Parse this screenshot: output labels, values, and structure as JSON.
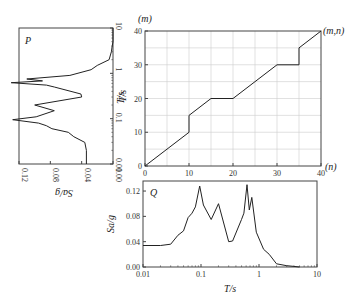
{
  "chart_data": [
    {
      "id": "P",
      "type": "line",
      "title": "P",
      "orientation": "rotated",
      "xlabel": "Sa/g",
      "ylabel": "T/s",
      "x_reversed": true,
      "xlim": [
        0.12,
        0.0
      ],
      "ylim": [
        0.01,
        10
      ],
      "y_scale": "log",
      "x_ticks": [
        "0.12",
        "0.08",
        "0.04",
        "0.00"
      ],
      "y_ticks": [
        "0.01",
        "0.1",
        "1",
        "10"
      ],
      "points": [
        [
          0.034,
          0.01
        ],
        [
          0.034,
          0.02
        ],
        [
          0.036,
          0.03
        ],
        [
          0.05,
          0.04
        ],
        [
          0.057,
          0.05
        ],
        [
          0.078,
          0.06
        ],
        [
          0.085,
          0.07
        ],
        [
          0.095,
          0.08
        ],
        [
          0.128,
          0.095
        ],
        [
          0.098,
          0.11
        ],
        [
          0.075,
          0.15
        ],
        [
          0.1,
          0.2
        ],
        [
          0.04,
          0.3
        ],
        [
          0.041,
          0.35
        ],
        [
          0.075,
          0.5
        ],
        [
          0.085,
          0.55
        ],
        [
          0.13,
          0.62
        ],
        [
          0.09,
          0.68
        ],
        [
          0.11,
          0.75
        ],
        [
          0.055,
          0.9
        ],
        [
          0.028,
          1.2
        ],
        [
          0.02,
          1.5
        ],
        [
          0.005,
          2
        ],
        [
          0.002,
          3
        ],
        [
          0.001,
          4
        ],
        [
          0.0,
          5
        ],
        [
          0.0,
          10
        ]
      ]
    },
    {
      "id": "mapping",
      "type": "line",
      "xlabel": "(n)",
      "ylabel": "T/s",
      "top_label": "(m)",
      "corner_label": "(m,n)",
      "xlim": [
        0,
        40
      ],
      "ylim": [
        0,
        40
      ],
      "grid": true,
      "x_ticks": [
        "0",
        "10",
        "20",
        "30",
        "40"
      ],
      "y_ticks": [
        "0",
        "10",
        "20",
        "30",
        "40"
      ],
      "points": [
        [
          0,
          0
        ],
        [
          10,
          10
        ],
        [
          10,
          15
        ],
        [
          15,
          20
        ],
        [
          20,
          20
        ],
        [
          30,
          30
        ],
        [
          35,
          30
        ],
        [
          35,
          35
        ],
        [
          40,
          40
        ]
      ]
    },
    {
      "id": "Q",
      "type": "line",
      "title": "Q",
      "xlabel": "T/s",
      "ylabel": "Sa/g",
      "x_scale": "log",
      "xlim": [
        0.01,
        10
      ],
      "ylim": [
        0.0,
        0.13
      ],
      "x_ticks": [
        "0.01",
        "0.1",
        "1",
        "10"
      ],
      "y_ticks": [
        "0.00",
        "0.04",
        "0.08",
        "0.12"
      ],
      "points": [
        [
          0.01,
          0.034
        ],
        [
          0.02,
          0.034
        ],
        [
          0.03,
          0.036
        ],
        [
          0.04,
          0.05
        ],
        [
          0.05,
          0.057
        ],
        [
          0.06,
          0.078
        ],
        [
          0.07,
          0.085
        ],
        [
          0.08,
          0.095
        ],
        [
          0.095,
          0.128
        ],
        [
          0.11,
          0.098
        ],
        [
          0.15,
          0.075
        ],
        [
          0.2,
          0.1
        ],
        [
          0.3,
          0.04
        ],
        [
          0.35,
          0.041
        ],
        [
          0.5,
          0.075
        ],
        [
          0.55,
          0.085
        ],
        [
          0.62,
          0.13
        ],
        [
          0.68,
          0.09
        ],
        [
          0.75,
          0.11
        ],
        [
          0.9,
          0.055
        ],
        [
          1.2,
          0.028
        ],
        [
          1.5,
          0.02
        ],
        [
          2,
          0.005
        ],
        [
          3,
          0.002
        ],
        [
          4,
          0.001
        ],
        [
          5,
          0.0
        ]
      ]
    }
  ],
  "labels": {
    "p_title": "P",
    "q_title": "Q",
    "m_label": "(m)",
    "mn_label": "(m,n)",
    "n_label": "(n)",
    "p_xlabel": "Sa/g",
    "p_ylabel": "T/s",
    "main_ylabel": "T/s",
    "q_xlabel": "T/s",
    "q_ylabel": "Sa/g"
  }
}
